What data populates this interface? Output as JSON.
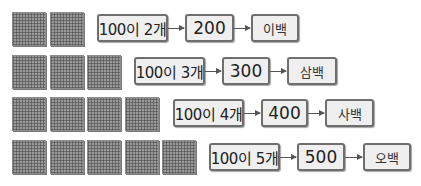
{
  "rows": [
    {
      "blocks": 2,
      "count_label": "100이 2개",
      "number": "200",
      "word": "이백"
    },
    {
      "blocks": 3,
      "count_label": "100이 3개",
      "number": "300",
      "word": "삼백"
    },
    {
      "blocks": 4,
      "count_label": "100이 4개",
      "number": "400",
      "word": "사백"
    },
    {
      "blocks": 5,
      "count_label": "100이 5개",
      "number": "500",
      "word": "오백"
    }
  ],
  "colors": {
    "block": "#9a9a9a",
    "box_fill": "#efefef",
    "box_border": "#6e6e6e",
    "arrow": "#555555"
  }
}
